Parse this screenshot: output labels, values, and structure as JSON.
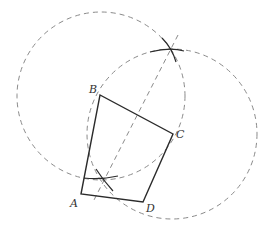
{
  "diagram": {
    "colors": {
      "solid": "#2b2b2b",
      "dashed": "#8a8a8a",
      "label": "#333333"
    },
    "points": [
      {
        "label": "A",
        "x": 81,
        "y": 194,
        "lx": 70,
        "ly": 207
      },
      {
        "label": "B",
        "x": 100,
        "y": 95,
        "lx": 89,
        "ly": 93
      },
      {
        "label": "C",
        "x": 173,
        "y": 134,
        "lx": 176,
        "ly": 138
      },
      {
        "label": "D",
        "x": 143,
        "y": 202,
        "lx": 146,
        "ly": 212
      }
    ],
    "circles": [
      {
        "center": "B",
        "cx": 101,
        "cy": 96,
        "r": 84
      },
      {
        "center": "C",
        "cx": 172,
        "cy": 134,
        "r": 85
      }
    ],
    "intersections": [
      {
        "x": 171,
        "y": 50
      },
      {
        "x": 103,
        "y": 178
      }
    ],
    "bisector": {
      "x1": 178,
      "y1": 35,
      "x2": 94,
      "y2": 200
    }
  }
}
